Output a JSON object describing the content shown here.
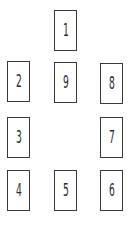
{
  "diagram": {
    "type": "card-spread-layout",
    "cards": [
      {
        "label": "1",
        "x": 54,
        "y": 10
      },
      {
        "label": "2",
        "x": 7,
        "y": 61
      },
      {
        "label": "9",
        "x": 54,
        "y": 62
      },
      {
        "label": "8",
        "x": 100,
        "y": 63
      },
      {
        "label": "3",
        "x": 7,
        "y": 117
      },
      {
        "label": "7",
        "x": 100,
        "y": 117
      },
      {
        "label": "4",
        "x": 7,
        "y": 170
      },
      {
        "label": "5",
        "x": 54,
        "y": 170
      },
      {
        "label": "6",
        "x": 100,
        "y": 170
      }
    ],
    "colors": {
      "border": "#3a3a3a",
      "text": "#2a2a2a",
      "background": "#ffffff"
    }
  }
}
